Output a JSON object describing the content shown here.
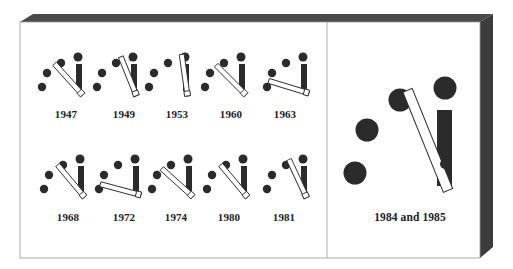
{
  "figure": {
    "colors": {
      "ink": "#2b2b2b",
      "bevel_top": "#4a4a4a",
      "bevel_side": "#3c3c3c",
      "frame": "#9a9a9a",
      "paper": "#ffffff"
    },
    "panels": {
      "small": [
        {
          "label": "1947",
          "hand_angle": -42
        },
        {
          "label": "1949",
          "hand_angle": -22
        },
        {
          "label": "1953",
          "hand_angle": -8
        },
        {
          "label": "1960",
          "hand_angle": -45
        },
        {
          "label": "1963",
          "hand_angle": -73
        },
        {
          "label": "1968",
          "hand_angle": -40
        },
        {
          "label": "1972",
          "hand_angle": -75
        },
        {
          "label": "1974",
          "hand_angle": -48
        },
        {
          "label": "1980",
          "hand_angle": -40
        },
        {
          "label": "1981",
          "hand_angle": -25
        }
      ],
      "large": {
        "label": "1984 and 1985",
        "hand_angle": -22
      }
    }
  }
}
